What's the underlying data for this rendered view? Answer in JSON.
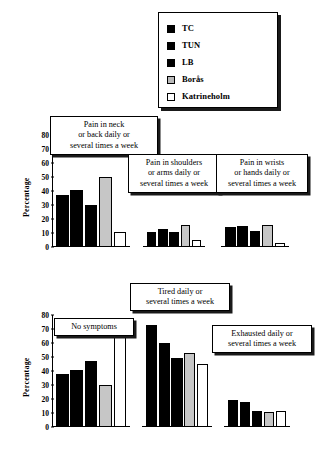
{
  "legend": {
    "name": "legend",
    "entries": [
      {
        "label": "TC",
        "swatch": "black"
      },
      {
        "label": "TUN",
        "swatch": "black"
      },
      {
        "label": "LB",
        "swatch": "black"
      },
      {
        "label": "Borås",
        "swatch": "gray"
      },
      {
        "label": "Katrineholm",
        "swatch": "white"
      }
    ]
  },
  "axis": {
    "ylabel": "Percentage",
    "ticks": [
      "80",
      "70",
      "60",
      "50",
      "40",
      "30",
      "20",
      "10",
      "0"
    ]
  },
  "chart_data": [
    {
      "type": "bar",
      "id": "pain-neck-back",
      "title": "Pain in neck\nor back daily or\nseveral times a week",
      "categories": [
        "TC",
        "TUN",
        "LB",
        "Borås",
        "Katrineholm"
      ],
      "values": [
        37,
        41,
        30,
        50,
        10.5
      ],
      "fills": [
        "black",
        "black",
        "black",
        "gray",
        "white"
      ],
      "xlabel": "",
      "ylabel": "Percentage",
      "ylim": [
        0,
        80
      ],
      "grid": false,
      "has_axis": true
    },
    {
      "type": "bar",
      "id": "pain-shoulders-arms",
      "title": "Pain in shoulders\nor arms daily or\nseveral times a week",
      "categories": [
        "TC",
        "TUN",
        "LB",
        "Borås",
        "Katrineholm"
      ],
      "values": [
        23,
        27,
        23,
        34,
        10.5
      ],
      "fills": [
        "black",
        "black",
        "black",
        "gray",
        "white"
      ],
      "xlabel": "",
      "ylabel": "",
      "ylim": [
        0,
        80
      ],
      "grid": false,
      "has_axis": false
    },
    {
      "type": "bar",
      "id": "pain-wrists-hands",
      "title": "Pain in wrists\nor hands daily or\nseveral times a week",
      "categories": [
        "TC",
        "TUN",
        "LB",
        "Borås",
        "Katrineholm"
      ],
      "values": [
        31,
        32,
        25,
        34,
        6
      ],
      "fills": [
        "black",
        "black",
        "black",
        "gray",
        "white"
      ],
      "xlabel": "",
      "ylabel": "",
      "ylim": [
        0,
        80
      ],
      "grid": false,
      "has_axis": false
    },
    {
      "type": "bar",
      "id": "no-symptoms",
      "title": "No symptoms",
      "categories": [
        "TC",
        "TUN",
        "LB",
        "Borås",
        "Katrineholm"
      ],
      "values": [
        38,
        41,
        47,
        30,
        67
      ],
      "fills": [
        "black",
        "black",
        "black",
        "gray",
        "white"
      ],
      "xlabel": "",
      "ylabel": "Percentage",
      "ylim": [
        0,
        80
      ],
      "grid": false,
      "has_axis": true
    },
    {
      "type": "bar",
      "id": "tired",
      "title": "Tired daily or\nseveral times a week",
      "categories": [
        "TC",
        "TUN",
        "LB",
        "Borås",
        "Katrineholm"
      ],
      "values": [
        73,
        60,
        49,
        53,
        45
      ],
      "fills": [
        "black",
        "black",
        "black",
        "gray",
        "white"
      ],
      "xlabel": "",
      "ylabel": "",
      "ylim": [
        0,
        80
      ],
      "grid": false,
      "has_axis": false
    },
    {
      "type": "bar",
      "id": "exhausted",
      "title": "Exhausted daily or\nseveral times a week",
      "categories": [
        "TC",
        "TUN",
        "LB",
        "Borås",
        "Katrineholm"
      ],
      "values": [
        40,
        36,
        23,
        22,
        24
      ],
      "fills": [
        "black",
        "black",
        "black",
        "gray",
        "white"
      ],
      "xlabel": "",
      "ylabel": "",
      "ylim": [
        0,
        80
      ],
      "grid": false,
      "has_axis": false
    }
  ]
}
